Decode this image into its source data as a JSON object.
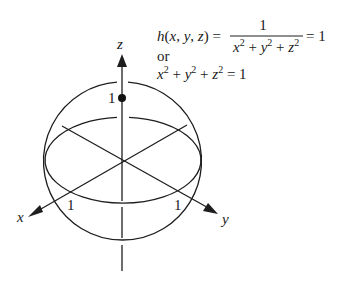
{
  "figure": {
    "formula": {
      "line1_lhs": "h(x, y, z) =",
      "numerator": "1",
      "denominator": "x² + y² + z²",
      "line1_rhs": "= 1",
      "connector": "or",
      "line3": "x² + y² + z² = 1"
    },
    "axes": {
      "x_label": "x",
      "y_label": "y",
      "z_label": "z"
    },
    "tick_labels": {
      "z_one": "1",
      "x_one": "1",
      "y_one": "1"
    },
    "colors": {
      "stroke": "#1e1e1e",
      "background": "#ffffff"
    }
  }
}
